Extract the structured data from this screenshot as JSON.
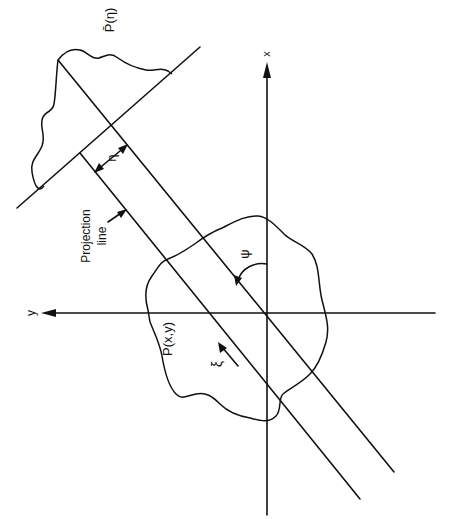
{
  "figure": {
    "type": "projection-geometry-diagram",
    "orientation": "rotated 90 degrees counter-clockwise",
    "colors": {
      "ink": "#111111",
      "background": "#ffffff"
    }
  },
  "axes": {
    "x_label": "x",
    "y_label": "y"
  },
  "labels": {
    "projection_function": "P̄(η)",
    "object_function": "P(x,y)",
    "projection_line_line1": "Projection",
    "projection_line_line2": "line",
    "eta": "η",
    "xi": "ξ",
    "psi": "ψ"
  }
}
